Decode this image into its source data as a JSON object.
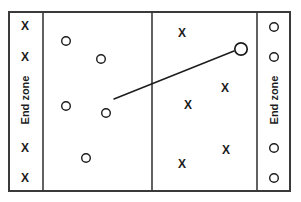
{
  "diagram": {
    "type": "ultimate-frisbee-field-play-diagram",
    "title": "",
    "background_color": "#ffffff",
    "line_color": "#3a3a3a",
    "marker_color": "#1c1c1c"
  },
  "field": {
    "border": {
      "x": 9,
      "y": 12,
      "width": 281,
      "height": 179
    },
    "dividers": [
      {
        "name": "left-endzone-line",
        "x": 43
      },
      {
        "name": "midfield-line",
        "x": 152
      },
      {
        "name": "right-endzone-line",
        "x": 257
      }
    ]
  },
  "endzones": [
    {
      "name": "left-endzone",
      "label": "End zone",
      "label_x": 25,
      "label_y": 100,
      "rotation": -90
    },
    {
      "name": "right-endzone",
      "label": "End zone",
      "label_x": 274,
      "label_y": 100,
      "rotation": -90
    }
  ],
  "markers": [
    {
      "name": "defender-left-endzone-1",
      "symbol": "X",
      "x": 25,
      "y": 26,
      "size": "normal"
    },
    {
      "name": "defender-left-endzone-2",
      "symbol": "X",
      "x": 25,
      "y": 57,
      "size": "normal"
    },
    {
      "name": "defender-left-endzone-3",
      "symbol": "X",
      "x": 25,
      "y": 148,
      "size": "normal"
    },
    {
      "name": "defender-left-endzone-4",
      "symbol": "X",
      "x": 25,
      "y": 178,
      "size": "normal"
    },
    {
      "name": "offense-player-1",
      "symbol": "O",
      "x": 66,
      "y": 41,
      "size": "normal"
    },
    {
      "name": "offense-player-2",
      "symbol": "O",
      "x": 101,
      "y": 59,
      "size": "normal"
    },
    {
      "name": "offense-player-3",
      "symbol": "O",
      "x": 66,
      "y": 106,
      "size": "normal"
    },
    {
      "name": "offense-thrower",
      "symbol": "O",
      "x": 106,
      "y": 113,
      "size": "normal"
    },
    {
      "name": "offense-player-5",
      "symbol": "O",
      "x": 86,
      "y": 158,
      "size": "normal"
    },
    {
      "name": "offense-receiver",
      "symbol": "O",
      "x": 241,
      "y": 49,
      "size": "large"
    },
    {
      "name": "defender-field-1",
      "symbol": "X",
      "x": 182,
      "y": 33,
      "size": "normal"
    },
    {
      "name": "defender-field-2",
      "symbol": "X",
      "x": 225,
      "y": 88,
      "size": "normal"
    },
    {
      "name": "defender-field-3",
      "symbol": "X",
      "x": 188,
      "y": 105,
      "size": "normal"
    },
    {
      "name": "defender-field-4",
      "symbol": "X",
      "x": 182,
      "y": 164,
      "size": "normal"
    },
    {
      "name": "defender-field-5",
      "symbol": "X",
      "x": 226,
      "y": 150,
      "size": "normal"
    },
    {
      "name": "offense-right-endzone-1",
      "symbol": "O",
      "x": 274,
      "y": 27,
      "size": "normal"
    },
    {
      "name": "offense-right-endzone-2",
      "symbol": "O",
      "x": 274,
      "y": 57,
      "size": "normal"
    },
    {
      "name": "offense-right-endzone-3",
      "symbol": "O",
      "x": 274,
      "y": 148,
      "size": "normal"
    },
    {
      "name": "offense-right-endzone-4",
      "symbol": "O",
      "x": 274,
      "y": 178,
      "size": "normal"
    }
  ],
  "pass_line": {
    "name": "pass-trajectory",
    "from_x": 114,
    "from_y": 99,
    "to_x": 234,
    "to_y": 51
  }
}
